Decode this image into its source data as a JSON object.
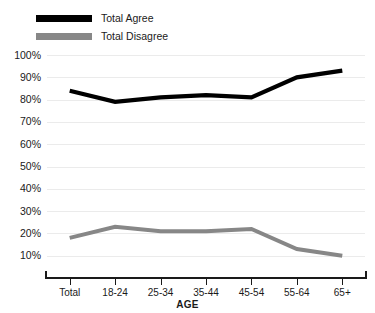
{
  "legend": {
    "position": "top-left",
    "items": [
      {
        "label": "Total Agree",
        "color": "#000000",
        "swatch": "agree"
      },
      {
        "label": "Total Disagree",
        "color": "#878787",
        "swatch": "disagree"
      }
    ]
  },
  "axis": {
    "x_title": "AGE",
    "y_ticks": [
      "100%",
      "90%",
      "80%",
      "70%",
      "60%",
      "50%",
      "40%",
      "30%",
      "20%",
      "10%"
    ]
  },
  "chart_data": {
    "type": "line",
    "title": "",
    "subtitle": "",
    "xlabel": "AGE",
    "ylabel": "",
    "categories": [
      "Total",
      "18-24",
      "25-34",
      "35-44",
      "45-54",
      "55-64",
      "65+"
    ],
    "series": [
      {
        "name": "Total Agree",
        "color": "#000000",
        "values": [
          84,
          79,
          81,
          82,
          81,
          90,
          93
        ]
      },
      {
        "name": "Total Disagree",
        "color": "#878787",
        "values": [
          18,
          23,
          21,
          21,
          22,
          13,
          10
        ]
      }
    ],
    "ylim": [
      0,
      100
    ],
    "ytick_values": [
      100,
      90,
      80,
      70,
      60,
      50,
      40,
      30,
      20,
      10
    ],
    "ytick_labels": [
      "100%",
      "90%",
      "80%",
      "70%",
      "60%",
      "50%",
      "40%",
      "30%",
      "20%",
      "10%"
    ],
    "grid": true,
    "grid_color": "#ebebeb",
    "legend_position": "top-left",
    "legend_entries": [
      "Total Agree",
      "Total Disagree"
    ]
  }
}
